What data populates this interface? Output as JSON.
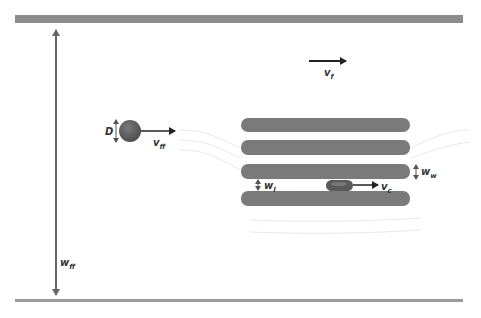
{
  "diagram": {
    "type": "microfluidic-channel-schematic",
    "colors": {
      "wall": "#8c8c8c",
      "bottom_wall": "#9a9a9a",
      "bar": "#7a7a7a",
      "particle": "#5e5e5e",
      "arrow": "#222222",
      "streamline": "#e6e6e6"
    },
    "labels": {
      "fluid_velocity": {
        "main": "v",
        "sub": "f"
      },
      "free_flow_velocity": {
        "main": "v",
        "sub": "ff"
      },
      "diameter": {
        "main": "D"
      },
      "channel_width": {
        "main": "w",
        "sub": "ff"
      },
      "wall_width": {
        "main": "w",
        "sub": "w"
      },
      "gap_width": {
        "main": "w",
        "sub": "l"
      },
      "cell_velocity": {
        "main": "v",
        "sub": "c"
      }
    },
    "elements": {
      "top_wall": "channel top wall",
      "bottom_wall": "channel bottom wall",
      "bars": 4,
      "free_particle": "sphere of diameter D",
      "confined_cell": "deformed cell in constriction"
    }
  }
}
